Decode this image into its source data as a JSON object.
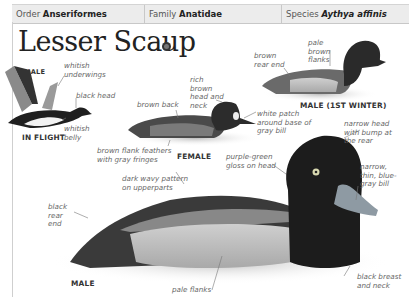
{
  "header": {
    "order_label": "Order",
    "order_value": "Anseriformes",
    "family_label": "Family",
    "family_value": "Anatidae",
    "species_label": "Species",
    "species_value": "Aythya affinis"
  },
  "title": "Lesser Scaup",
  "audio_icon": "speaker-icon",
  "captions": {
    "flight_sex": "MALE",
    "flight": "IN FLIGHT",
    "first_winter": "MALE (1ST WINTER)",
    "female": "FEMALE",
    "male": "MALE"
  },
  "labels": {
    "whitish_underwings": "whitish underwings",
    "black_head": "black head",
    "whitish_belly": "whitish belly",
    "brown_rear_end": "brown rear end",
    "pale_brown_flanks": "pale brown flanks",
    "rich_brown_head": "rich brown head and neck",
    "brown_back": "brown back",
    "white_patch": "white patch around base of gray bill",
    "brown_flank_feathers": "brown flank feathers with gray fringes",
    "purple_green_gloss": "purple-green gloss on head",
    "narrow_head": "narrow head with bump at the rear",
    "dark_wavy_pattern": "dark wavy pattern on upperparts",
    "narrow_bill": "narrow, thin, blue-gray bill",
    "black_rear_end": "black rear end",
    "pale_flanks": "pale flanks",
    "black_breast": "black breast and neck"
  }
}
